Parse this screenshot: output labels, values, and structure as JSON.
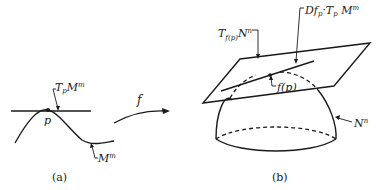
{
  "panel_a": {
    "caption": "(a)",
    "tangent_label": "T",
    "tangent_sub": "p",
    "tangent_rest": "M",
    "tangent_sup": "m",
    "point_label": "p",
    "manifold_label": "M",
    "manifold_sup": "m",
    "map_label": "f"
  },
  "panel_b": {
    "caption": "(b)",
    "plane_label": "T",
    "plane_sub": "f(p)",
    "plane_rest": "N",
    "plane_sup": "n",
    "image_label_a": "Df",
    "image_label_sub1": "p",
    "image_label_b": "·T",
    "image_label_sub2": "p",
    "image_label_c": " M",
    "image_label_sup": "m",
    "point_label": "f(p)",
    "manifold_label": "N",
    "manifold_sup": "n"
  }
}
